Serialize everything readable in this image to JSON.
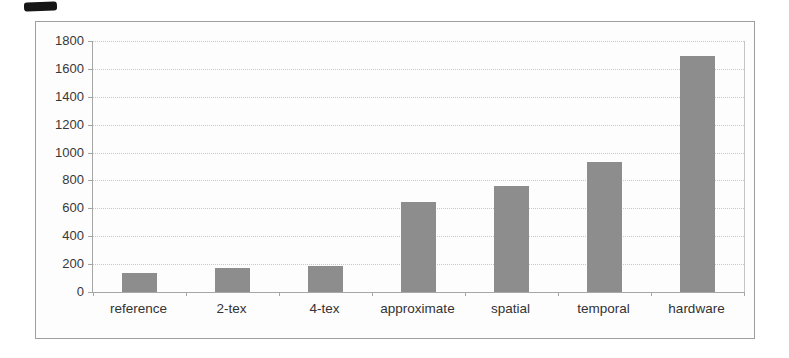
{
  "figure": {
    "background": "#fdfdfd",
    "border_color": "#9e9e9e",
    "scan_artifact": "dark-ink-mark-top-left"
  },
  "chart_data": {
    "type": "bar",
    "categories": [
      "reference",
      "2-tex",
      "4-tex",
      "approximate",
      "spatial",
      "temporal",
      "hardware"
    ],
    "values": [
      135,
      170,
      185,
      645,
      760,
      930,
      1690
    ],
    "title": "",
    "xlabel": "",
    "ylabel": "",
    "ylim": [
      0,
      1800
    ],
    "yticks": [
      0,
      200,
      400,
      600,
      800,
      1000,
      1200,
      1400,
      1600,
      1800
    ],
    "grid": true,
    "gridline_style": "dotted",
    "legend": null,
    "bar_color": "#8d8d8d",
    "gridline_color": "#c8c8c8",
    "axis_color": "#a6a6a6",
    "label_color": "#333333"
  }
}
